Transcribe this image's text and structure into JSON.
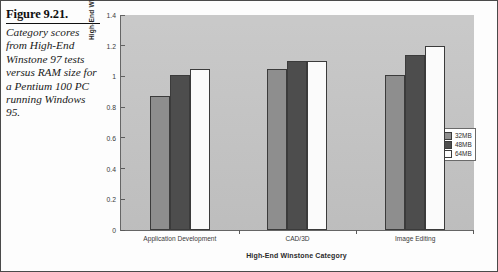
{
  "caption": {
    "title": "Figure 9.21.",
    "body": "Category scores from High-End Winstone 97 tests versus RAM size for a Pentium 100 PC running Windows 95."
  },
  "chart_data": {
    "type": "bar",
    "title": "",
    "xlabel": "High-End Winstone Category",
    "ylabel": "High-End Winstone Category Score",
    "categories": [
      "Application Development",
      "CAD/3D",
      "Image Editing"
    ],
    "series": [
      {
        "name": "32MB",
        "color": "#8e8e8e",
        "values": [
          0.87,
          1.05,
          1.01
        ]
      },
      {
        "name": "48MB",
        "color": "#4d4d4d",
        "values": [
          1.01,
          1.1,
          1.14
        ]
      },
      {
        "name": "64MB",
        "color": "#fbfbfb",
        "values": [
          1.05,
          1.1,
          1.2
        ]
      }
    ],
    "ylim": [
      0,
      1.4
    ],
    "yticks": [
      "0",
      "0.2",
      "0.4",
      "0.6",
      "0.8",
      "1",
      "1.2",
      "1.4"
    ],
    "ytick_values": [
      0,
      0.2,
      0.4,
      0.6,
      0.8,
      1,
      1.2,
      1.4
    ],
    "grid": false,
    "legend_position": "right",
    "plot_background": "#c6c6c6"
  }
}
